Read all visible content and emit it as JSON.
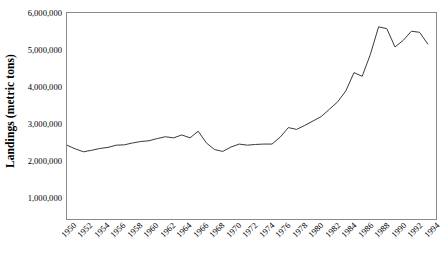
{
  "chart_data": {
    "type": "line",
    "title": "",
    "xlabel": "",
    "ylabel": "Landings (metric tons)",
    "xlim": [
      1950,
      1995
    ],
    "ylim": [
      0,
      6000000
    ],
    "grid": false,
    "legend": null,
    "y_tick_labels": [
      "6,000,000",
      "5,000,000",
      "4,000,000",
      "3,000,000",
      "2,000,000",
      "1,000,000"
    ],
    "y_tick_values": [
      6000000,
      5000000,
      4000000,
      3000000,
      2000000,
      1000000
    ],
    "x_tick_labels": [
      "1950",
      "1952",
      "1954",
      "1956",
      "1958",
      "1960",
      "1962",
      "1964",
      "1966",
      "1968",
      "1970",
      "1972",
      "1974",
      "1976",
      "1978",
      "1980",
      "1982",
      "1984",
      "1986",
      "1988",
      "1990",
      "1992",
      "1994"
    ],
    "x_tick_values": [
      1950,
      1952,
      1954,
      1956,
      1958,
      1960,
      1962,
      1964,
      1966,
      1968,
      1970,
      1972,
      1974,
      1976,
      1978,
      1980,
      1982,
      1984,
      1986,
      1988,
      1990,
      1992,
      1994
    ],
    "line_color": "#3a3a3a",
    "x": [
      1950,
      1951,
      1952,
      1953,
      1954,
      1955,
      1956,
      1957,
      1958,
      1959,
      1960,
      1961,
      1962,
      1963,
      1964,
      1965,
      1966,
      1967,
      1968,
      1969,
      1970,
      1971,
      1972,
      1973,
      1974,
      1975,
      1976,
      1977,
      1978,
      1979,
      1980,
      1981,
      1982,
      1983,
      1984,
      1985,
      1986,
      1987,
      1988,
      1989,
      1990,
      1991,
      1992,
      1993,
      1994
    ],
    "values": [
      2420000,
      2320000,
      2240000,
      2280000,
      2330000,
      2360000,
      2420000,
      2430000,
      2480000,
      2520000,
      2540000,
      2600000,
      2650000,
      2620000,
      2700000,
      2620000,
      2800000,
      2480000,
      2300000,
      2250000,
      2370000,
      2450000,
      2420000,
      2440000,
      2450000,
      2450000,
      2640000,
      2900000,
      2850000,
      2960000,
      3080000,
      3200000,
      3400000,
      3600000,
      3900000,
      4400000,
      4300000,
      4900000,
      5650000,
      5600000,
      5100000,
      5280000,
      5530000,
      5500000,
      5180000
    ]
  },
  "axis_titles": {
    "y": "Landings (metric tons)"
  }
}
